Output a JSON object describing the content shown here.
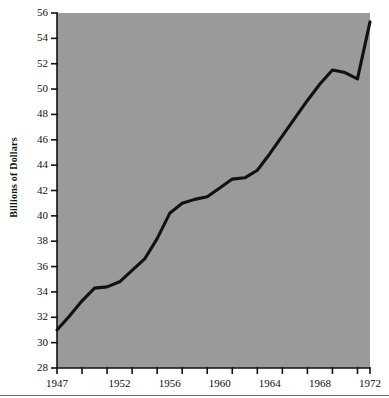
{
  "chart_data": {
    "type": "line",
    "title": "",
    "xlabel": "",
    "ylabel": "Billions of Dollars",
    "xlim": [
      1947,
      1972
    ],
    "ylim": [
      28,
      56
    ],
    "grid": false,
    "legend": "none",
    "plot_background": "#9a9a9a",
    "line_color": "#111111",
    "x": [
      1947,
      1948,
      1949,
      1950,
      1951,
      1952,
      1953,
      1954,
      1955,
      1956,
      1957,
      1958,
      1959,
      1960,
      1961,
      1962,
      1963,
      1964,
      1965,
      1966,
      1967,
      1968,
      1969,
      1970,
      1971,
      1972
    ],
    "values": [
      31.0,
      32.1,
      33.3,
      34.3,
      34.4,
      34.8,
      35.7,
      36.6,
      38.2,
      40.2,
      41.0,
      41.3,
      41.5,
      42.2,
      42.9,
      43.0,
      43.6,
      44.9,
      46.3,
      47.7,
      49.1,
      50.4,
      51.5,
      51.3,
      50.8,
      55.3
    ],
    "y_ticks": [
      56,
      54,
      52,
      50,
      48,
      46,
      44,
      42,
      40,
      38,
      36,
      34,
      32,
      30,
      28
    ],
    "x_ticks_labeled": [
      1947,
      1952,
      1956,
      1960,
      1964,
      1968,
      1972
    ],
    "x_ticks_minor_step": 2,
    "x_tick_positions": [
      1947,
      1949,
      1951,
      1953,
      1955,
      1957,
      1959,
      1961,
      1963,
      1965,
      1967,
      1969,
      1971
    ]
  }
}
